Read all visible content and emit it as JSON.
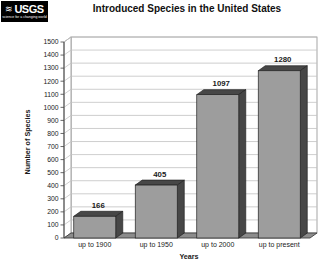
{
  "logo": {
    "name": "USGS",
    "tagline": "science for a changing world"
  },
  "title": "Introduced Species in the United States",
  "chart_data": {
    "type": "bar",
    "style": "3d",
    "title": "Introduced Species in the United States",
    "categories": [
      "up to 1900",
      "up to 1950",
      "up to 2000",
      "up to present"
    ],
    "values": [
      166,
      405,
      1097,
      1280
    ],
    "value_labels": [
      "166",
      "405",
      "1097",
      "1280"
    ],
    "xlabel": "Years",
    "ylabel": "Number of Species",
    "ylim": [
      0,
      1500
    ],
    "ytick_step": 100,
    "grid": true,
    "legend": false,
    "colors": {
      "bar_front": "#9d9d9d",
      "bar_side": "#474747",
      "bar_outline": "#222222",
      "wall": "#ffffff",
      "wall_border": "#8f8f8f",
      "gridline": "#c2c2c2",
      "floor": "#8c8c8c",
      "floor_outline": "#3f3f3f",
      "axis": "#444444",
      "text": "#1a1a1a"
    }
  }
}
